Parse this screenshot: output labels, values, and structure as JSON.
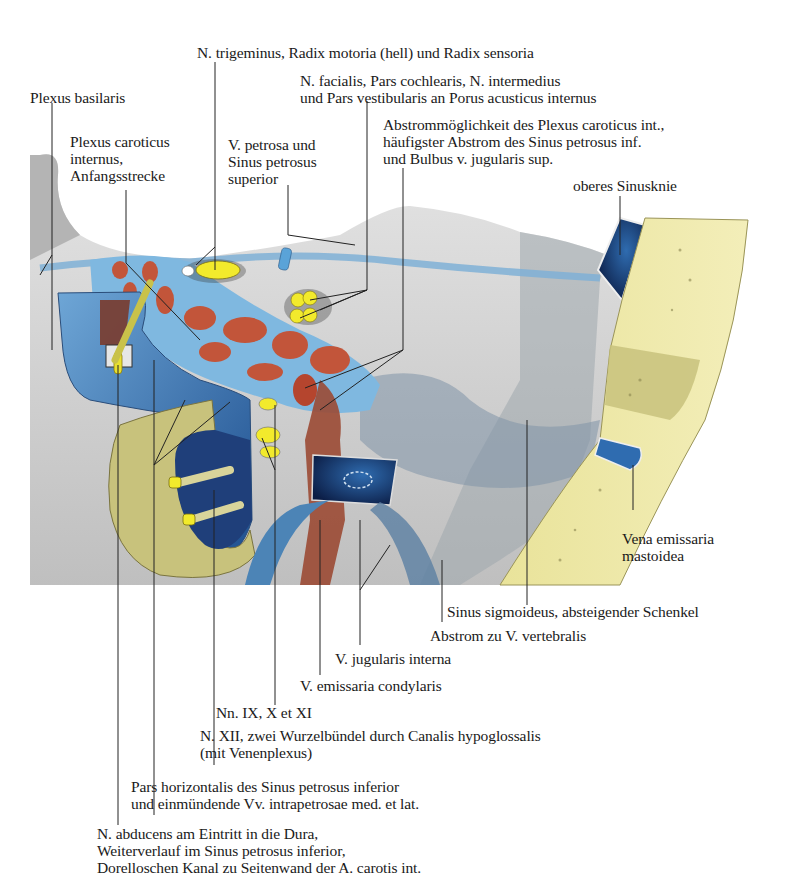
{
  "figure": {
    "colors": {
      "dura": "#c9c9c9",
      "dura_dark": "#8e959b",
      "sinus_blue": "#4f8fc4",
      "sinus_dark": "#10275c",
      "artery_red": "#c2553a",
      "nerve_yellow": "#f2ea2c",
      "bone_yellow": "#eee8a8",
      "bone_dark": "#c8c27c"
    }
  },
  "labels": {
    "trigeminus": [
      "N. trigeminus, Radix motoria (hell) und Radix sensoria"
    ],
    "facialis": [
      "N. facialis, Pars cochlearis, N. intermedius",
      "und Pars vestibularis an Porus acusticus internus"
    ],
    "plexus_basilaris": [
      "Plexus basilaris"
    ],
    "abstrommoeglichkeit": [
      "Abstrommöglichkeit des Plexus caroticus int.,",
      "häufigster Abstrom des Sinus petrosus inf.",
      "und Bulbus v. jugularis sup."
    ],
    "plexus_caroticus": [
      "Plexus caroticus",
      "internus,",
      "Anfangsstrecke"
    ],
    "v_petrosa": [
      "V. petrosa und",
      "Sinus petrosus",
      "superior"
    ],
    "oberes_sinusknie": [
      "oberes Sinusknie"
    ],
    "vena_emissaria_mastoidea": [
      "Vena emissaria",
      "mastoidea"
    ],
    "sinus_sigmoideus": [
      "Sinus sigmoideus, absteigender Schenkel"
    ],
    "abstrom_vertebralis": [
      "Abstrom zu V. vertebralis"
    ],
    "v_jugularis_interna": [
      "V. jugularis interna"
    ],
    "v_emissaria_condylaris": [
      "V. emissaria condylaris"
    ],
    "nn_ix_x_xi": [
      "Nn. IX, X et XI"
    ],
    "n_xii": [
      "N. XII, zwei Wurzelbündel durch Canalis hypoglossalis",
      "(mit Venenplexus)"
    ],
    "pars_horizontalis": [
      "Pars horizontalis des Sinus petrosus inferior",
      "und einmündende Vv. intrapetrosae med. et lat."
    ],
    "n_abducens": [
      "N. abducens am Eintritt in die Dura,",
      "Weiterverlauf im Sinus petrosus inferior,",
      "Dorelloschen Kanal zu Seitenwand der A. carotis int."
    ]
  }
}
